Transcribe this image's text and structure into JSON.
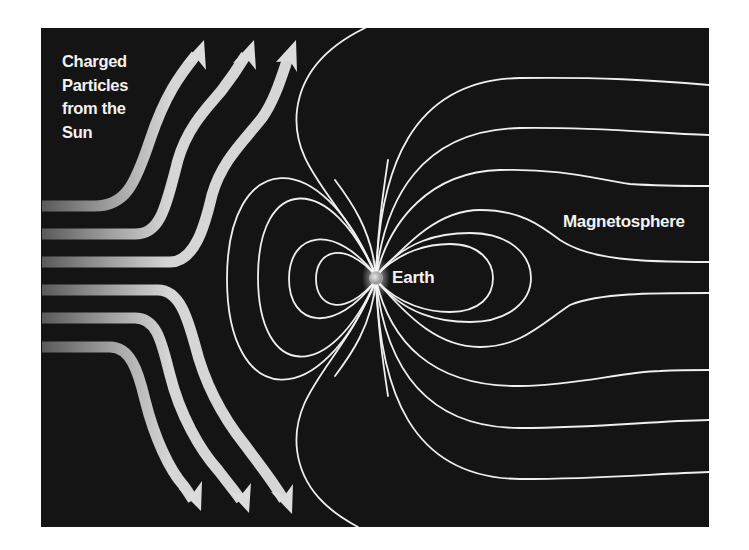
{
  "diagram": {
    "background_color": "#141414",
    "field_line_color": "#f0f0f0",
    "arrow_color": "#d9d9d9",
    "labels": {
      "particles_lines": [
        "Charged",
        "Particles",
        "from the",
        "Sun"
      ],
      "earth": "Earth",
      "magnetosphere": "Magnetosphere"
    },
    "elements": {
      "earth": {
        "shape": "small sphere",
        "cx": 376,
        "cy": 278
      },
      "particle_arrows": {
        "count": 6,
        "upper_deflected": 3,
        "lower_deflected": 3
      },
      "field_lines": {
        "left_closed_loops": 4,
        "right_closed_loops": 2,
        "right_open_lines_top": 4,
        "right_open_lines_bottom": 4,
        "left_open_lines": 2
      }
    }
  }
}
